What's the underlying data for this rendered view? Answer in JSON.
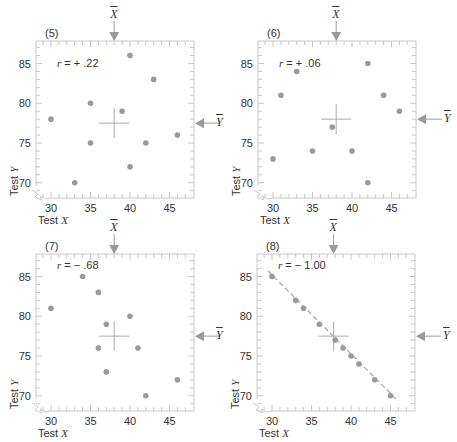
{
  "chart_data": [
    {
      "type": "scatter",
      "panel_label": "(5)",
      "annotation": "r = + .22",
      "r": 0.22,
      "xlabel": "Test X",
      "ylabel": "Test Y",
      "x_ticks": [
        30,
        35,
        40,
        45
      ],
      "y_ticks": [
        70,
        75,
        80,
        85
      ],
      "xlim": [
        28,
        48
      ],
      "ylim": [
        68,
        88
      ],
      "mean_markers": {
        "x_label": "X̄",
        "y_label": "Ȳ",
        "x_mean": 38,
        "y_mean": 77.5
      },
      "points": [
        [
          30,
          78
        ],
        [
          33,
          70
        ],
        [
          35,
          80
        ],
        [
          35,
          75
        ],
        [
          39,
          79
        ],
        [
          40,
          86
        ],
        [
          40,
          72
        ],
        [
          42,
          75
        ],
        [
          43,
          83
        ],
        [
          46,
          76
        ]
      ]
    },
    {
      "type": "scatter",
      "panel_label": "(6)",
      "annotation": "r = + .06",
      "r": 0.06,
      "xlabel": "Test X",
      "ylabel": "Test Y",
      "x_ticks": [
        30,
        35,
        40,
        45
      ],
      "y_ticks": [
        70,
        75,
        80,
        85
      ],
      "xlim": [
        28,
        48
      ],
      "ylim": [
        68,
        88
      ],
      "mean_markers": {
        "x_label": "X̄",
        "y_label": "Ȳ",
        "x_mean": 38,
        "y_mean": 78
      },
      "points": [
        [
          30,
          73
        ],
        [
          31,
          81
        ],
        [
          33,
          84
        ],
        [
          35,
          74
        ],
        [
          37.5,
          77
        ],
        [
          40,
          74
        ],
        [
          42,
          70
        ],
        [
          42,
          85
        ],
        [
          44,
          81
        ],
        [
          46,
          79
        ]
      ]
    },
    {
      "type": "scatter",
      "panel_label": "(7)",
      "annotation": "r = − .68",
      "r": -0.68,
      "xlabel": "Test X",
      "ylabel": "Test Y",
      "x_ticks": [
        30,
        35,
        40,
        45
      ],
      "y_ticks": [
        70,
        75,
        80,
        85
      ],
      "xlim": [
        28,
        48
      ],
      "ylim": [
        68,
        88
      ],
      "mean_markers": {
        "x_label": "X̄",
        "y_label": "Ȳ",
        "x_mean": 38,
        "y_mean": 77.5
      },
      "points": [
        [
          30,
          81
        ],
        [
          34,
          85
        ],
        [
          36,
          83
        ],
        [
          36,
          76
        ],
        [
          37,
          79
        ],
        [
          37,
          73
        ],
        [
          40,
          80
        ],
        [
          41,
          76
        ],
        [
          42,
          70
        ],
        [
          46,
          72
        ]
      ]
    },
    {
      "type": "scatter",
      "panel_label": "(8)",
      "annotation": "r = − 1.00",
      "r": -1.0,
      "xlabel": "Test X",
      "ylabel": "Test Y",
      "x_ticks": [
        30,
        35,
        40,
        45
      ],
      "y_ticks": [
        70,
        75,
        80,
        85
      ],
      "xlim": [
        28,
        48
      ],
      "ylim": [
        68,
        88
      ],
      "mean_markers": {
        "x_label": "X̄",
        "y_label": "Ȳ",
        "x_mean": 37.8,
        "y_mean": 77.5
      },
      "points": [
        [
          30,
          85
        ],
        [
          33,
          82
        ],
        [
          34,
          81
        ],
        [
          36,
          79
        ],
        [
          38,
          77
        ],
        [
          39,
          76
        ],
        [
          40,
          75
        ],
        [
          41,
          74
        ],
        [
          43,
          72
        ],
        [
          45,
          70
        ]
      ],
      "fit_line": [
        [
          29.5,
          85.7
        ],
        [
          46,
          69.3
        ]
      ]
    }
  ],
  "panels": [
    {
      "label": "(5)",
      "r_prefix": "r",
      "r_value": " = + .22"
    },
    {
      "label": "(6)",
      "r_prefix": "r",
      "r_value": " = + .06"
    },
    {
      "label": "(7)",
      "r_prefix": "r",
      "r_value": " = − .68"
    },
    {
      "label": "(8)",
      "r_prefix": "r",
      "r_value": " = − 1.00"
    }
  ],
  "axis": {
    "x_title_prefix": "Test ",
    "x_title_var": "X",
    "y_title_prefix": "Test ",
    "y_title_var": "Y",
    "x_ticks": [
      "30",
      "35",
      "40",
      "45"
    ],
    "y_ticks": [
      "85",
      "80",
      "75",
      "70"
    ],
    "x_mean_label": "X",
    "y_mean_label": "Y"
  },
  "colors": {
    "point": "#9a9a9a",
    "frame": "#c8c8c8",
    "arrow": "#9a9a9a",
    "text": "#333333"
  }
}
